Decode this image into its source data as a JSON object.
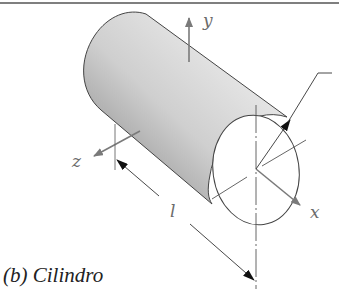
{
  "figure": {
    "caption": "(b) Cilindro",
    "shape": "cylinder",
    "axes": {
      "x_label": "x",
      "y_label": "y",
      "z_label": "z"
    },
    "dimensions": {
      "length_label": "l"
    },
    "colors": {
      "outline": "#444444",
      "axis_arrow": "#7a7a7a",
      "dimension_arrow": "#111111",
      "shade_dark": "#8a8a8a",
      "shade_light": "#f4f4f4"
    }
  }
}
